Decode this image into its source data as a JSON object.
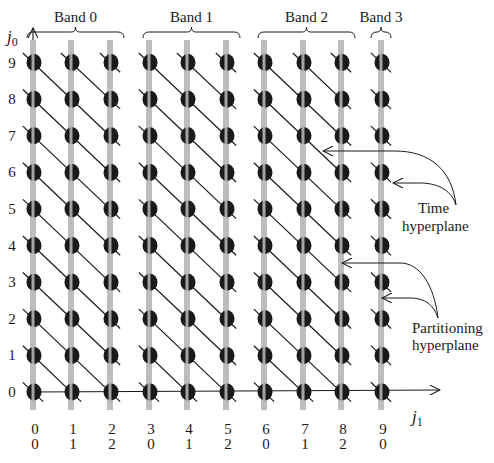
{
  "diagram": {
    "type": "iteration-space-partitioning",
    "axes": {
      "vertical": {
        "label": "j",
        "subscript": "0"
      },
      "horizontal": {
        "label": "j",
        "subscript": "1"
      }
    },
    "row_labels": [
      "0",
      "1",
      "2",
      "3",
      "4",
      "5",
      "6",
      "7",
      "8",
      "9"
    ],
    "column_labels_top": [
      "0",
      "1",
      "2",
      "3",
      "4",
      "5",
      "6",
      "7",
      "8",
      "9"
    ],
    "column_labels_bottom": [
      "0",
      "1",
      "2",
      "0",
      "1",
      "2",
      "0",
      "1",
      "2",
      "0"
    ],
    "bands": [
      {
        "label": "Band 0",
        "columns": [
          0,
          1,
          2
        ]
      },
      {
        "label": "Band 1",
        "columns": [
          3,
          4,
          5
        ]
      },
      {
        "label": "Band 2",
        "columns": [
          6,
          7,
          8
        ]
      },
      {
        "label": "Band 3",
        "columns": [
          9
        ]
      }
    ],
    "annotations": {
      "time_hyperplane": {
        "line1": "Time",
        "line2": "hyperplane"
      },
      "partitioning_hyperplane": {
        "line1": "Partitioning",
        "line2": "hyperplane"
      }
    },
    "colors": {
      "dot": "#1a1a1a",
      "partition_line": "#bdbdbd",
      "time_line": "#1a1a1a",
      "text": "#1a1a1a"
    }
  }
}
